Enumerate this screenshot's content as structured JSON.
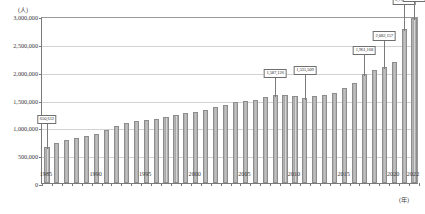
{
  "chart_title": "",
  "axis": {
    "y_unit": "(人)",
    "x_unit": "(年)",
    "yticks": [
      "0",
      "500,000",
      "1,000,000",
      "1,500,000",
      "2,000,000",
      "2,500,000",
      "3,000,000"
    ],
    "xticks": [
      "1985",
      "1990",
      "1995",
      "2000",
      "2005",
      "2010",
      "2015",
      "2020",
      "2022"
    ]
  },
  "chart_data": {
    "type": "bar",
    "title": "",
    "xlabel": "(年)",
    "ylabel": "(人)",
    "ylim": [
      0,
      3000000
    ],
    "ytick_values": [
      0,
      500000,
      1000000,
      1500000,
      2000000,
      2500000,
      3000000
    ],
    "grid": true,
    "legend": "none",
    "categories": [
      "1985",
      "1986",
      "1987",
      "1988",
      "1989",
      "1990",
      "1991",
      "1992",
      "1993",
      "1994",
      "1995",
      "1996",
      "1997",
      "1998",
      "1999",
      "2000",
      "2001",
      "2002",
      "2003",
      "2004",
      "2005",
      "2006",
      "2007",
      "2008",
      "2009",
      "2010",
      "2011",
      "2012",
      "2013",
      "2014",
      "2015",
      "2016",
      "2017",
      "2018",
      "2019",
      "2020",
      "2021",
      "2022"
    ],
    "values": [
      650612,
      720000,
      770000,
      800000,
      840000,
      880000,
      950000,
      1020000,
      1080000,
      1110000,
      1140000,
      1150000,
      1180000,
      1220000,
      1250000,
      1280000,
      1320000,
      1360000,
      1410000,
      1450000,
      1480000,
      1500000,
      1550000,
      1587126,
      1580000,
      1560000,
      1535509,
      1560000,
      1580000,
      1620000,
      1700000,
      1800000,
      1961168,
      2030000,
      2080000,
      2170000,
      2760635,
      2960000
    ],
    "annotations": [
      {
        "year": "1985",
        "value": 650612,
        "text": "650,612"
      },
      {
        "year": "2008",
        "value": 1587126,
        "text": "1,587,126"
      },
      {
        "year": "2011",
        "value": 1535509,
        "text": "1,535,509"
      },
      {
        "year": "2017",
        "value": 1961168,
        "text": "1,961,168"
      },
      {
        "year": "2019",
        "value": 2082157,
        "text": "2,082,157"
      },
      {
        "year": "2021",
        "value": 2760635,
        "text": "2,760,635"
      },
      {
        "year": "2022",
        "value": 2960000,
        "text": "2,960,000"
      }
    ]
  }
}
